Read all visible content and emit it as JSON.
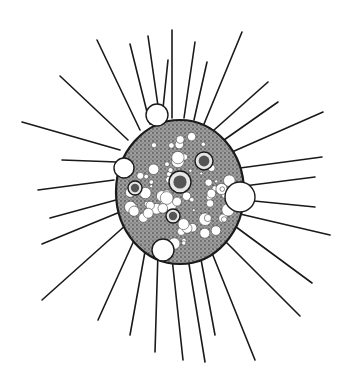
{
  "illustration": {
    "subject": "heliozoan-like protist with radiating axopods",
    "colors": {
      "background": "#ffffff",
      "ink": "#1a1a1a",
      "cytoplasm": "#8a8a8a"
    },
    "body": {
      "cx": 180,
      "cy": 192,
      "rx": 64,
      "ry": 72
    },
    "rays": [
      [
        172,
        118,
        172,
        30
      ],
      [
        160,
        120,
        148,
        36
      ],
      [
        150,
        124,
        130,
        44
      ],
      [
        140,
        130,
        97,
        40
      ],
      [
        128,
        140,
        60,
        76
      ],
      [
        120,
        150,
        22,
        122
      ],
      [
        117,
        162,
        62,
        160
      ],
      [
        114,
        180,
        38,
        190
      ],
      [
        116,
        200,
        50,
        218
      ],
      [
        120,
        212,
        42,
        244
      ],
      [
        127,
        224,
        42,
        300
      ],
      [
        136,
        236,
        98,
        320
      ],
      [
        146,
        246,
        130,
        335
      ],
      [
        158,
        252,
        155,
        352
      ],
      [
        172,
        258,
        183,
        360
      ],
      [
        188,
        258,
        205,
        362
      ],
      [
        200,
        254,
        215,
        335
      ],
      [
        210,
        248,
        255,
        360
      ],
      [
        222,
        238,
        300,
        316
      ],
      [
        232,
        224,
        312,
        283
      ],
      [
        240,
        214,
        330,
        235
      ],
      [
        244,
        200,
        315,
        207
      ],
      [
        244,
        186,
        315,
        177
      ],
      [
        240,
        168,
        322,
        157
      ],
      [
        232,
        152,
        323,
        112
      ],
      [
        224,
        140,
        278,
        102
      ],
      [
        214,
        130,
        268,
        82
      ],
      [
        204,
        124,
        242,
        32
      ],
      [
        194,
        120,
        207,
        62
      ],
      [
        184,
        118,
        195,
        42
      ],
      [
        162,
        118,
        168,
        60
      ]
    ],
    "vacuoles_large": [
      {
        "cx": 157,
        "cy": 115,
        "r": 11
      },
      {
        "cx": 240,
        "cy": 197,
        "r": 15
      },
      {
        "cx": 163,
        "cy": 250,
        "r": 11
      },
      {
        "cx": 124,
        "cy": 168,
        "r": 10
      }
    ],
    "nuclei": [
      {
        "cx": 180,
        "cy": 182,
        "r": 11,
        "kind": "central"
      },
      {
        "cx": 204,
        "cy": 161,
        "r": 9,
        "kind": "food-vacuole"
      },
      {
        "cx": 135,
        "cy": 188,
        "r": 7,
        "kind": "nucleus"
      },
      {
        "cx": 173,
        "cy": 216,
        "r": 7,
        "kind": "nucleus"
      }
    ]
  }
}
